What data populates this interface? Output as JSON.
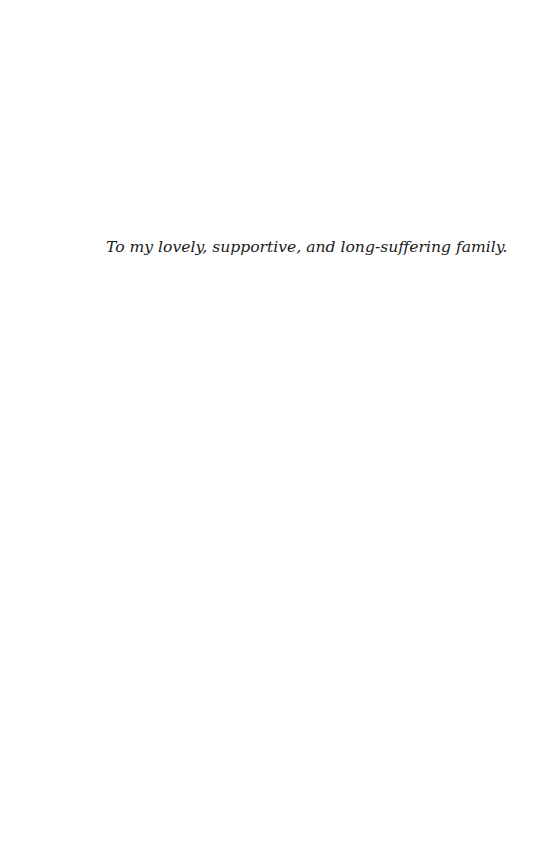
{
  "page": {
    "type": "dedication",
    "dedication_text": "To my lovely, supportive, and long-suffering family."
  }
}
